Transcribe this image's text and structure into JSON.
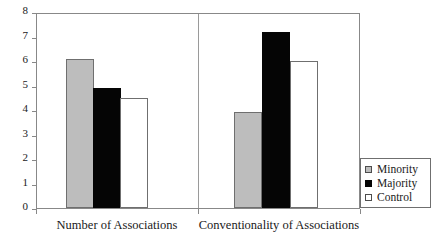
{
  "chart_data": {
    "type": "bar",
    "title": "",
    "subtitle": "",
    "xlabel": "",
    "ylabel": "",
    "ylim": [
      0,
      8
    ],
    "yticks": [
      0,
      1,
      2,
      3,
      4,
      5,
      6,
      7,
      8
    ],
    "grid": false,
    "legend_position": "bottom-right",
    "categories": [
      "Number of Associations",
      "Conventionality of Associations"
    ],
    "series": [
      {
        "name": "Minority",
        "color": "#bdbdbd",
        "values": [
          6.1,
          3.9
        ]
      },
      {
        "name": "Majority",
        "color": "#050505",
        "values": [
          4.9,
          7.2
        ]
      },
      {
        "name": "Control",
        "color": "#ffffff",
        "values": [
          4.5,
          6.0
        ]
      }
    ]
  },
  "legend": {
    "items": [
      {
        "label": "Minority"
      },
      {
        "label": "Majority"
      },
      {
        "label": "Control"
      }
    ]
  },
  "axis": {
    "y_tick_labels": [
      "8",
      "7",
      "6",
      "5",
      "4",
      "3",
      "2",
      "1",
      "0"
    ],
    "x_tick_labels": [
      "Number of Associations",
      "Conventionality of Associations"
    ]
  }
}
